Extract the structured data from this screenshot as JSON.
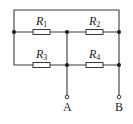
{
  "diagram": {
    "type": "circuit",
    "resistors": [
      {
        "id": "R1",
        "letter": "R",
        "sub": "1"
      },
      {
        "id": "R2",
        "letter": "R",
        "sub": "2"
      },
      {
        "id": "R3",
        "letter": "R",
        "sub": "3"
      },
      {
        "id": "R4",
        "letter": "R",
        "sub": "4"
      }
    ],
    "terminals": [
      {
        "id": "A",
        "label": "A"
      },
      {
        "id": "B",
        "label": "B"
      }
    ],
    "colors": {
      "wire": "#3a3a3a",
      "node": "#1a1a1a",
      "background": "#ffffff"
    }
  }
}
